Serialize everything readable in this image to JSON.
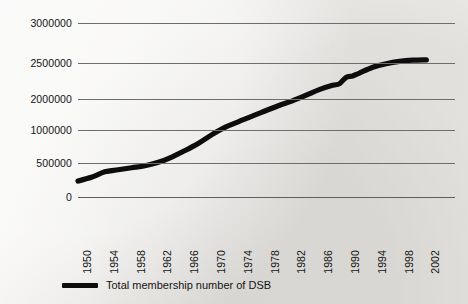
{
  "chart_data": {
    "type": "line",
    "title": "",
    "subtitle": "",
    "xlabel": "",
    "ylabel": "",
    "grid": true,
    "legend_position": "bottom-left",
    "x_tick_labels": [
      "1950",
      "1954",
      "1958",
      "1962",
      "1966",
      "1970",
      "1974",
      "1978",
      "1982",
      "1986",
      "1990",
      "1994",
      "1998",
      "2002"
    ],
    "y_tick_labels": [
      "3000000",
      "2500000",
      "2000000",
      "1000000",
      "500000",
      "0"
    ],
    "y_tick_values": [
      3000000,
      2500000,
      2000000,
      1000000,
      500000,
      0
    ],
    "y_axis_note": "Irregular tick spacing as printed: the 1500000 gridline is unlabelled and gaps between labelled ticks are not uniform.",
    "xlim": [
      1950,
      2002
    ],
    "ylim": [
      0,
      3000000
    ],
    "line_color": "#0d0d0d",
    "series": [
      {
        "name": "Total membership number of DSB",
        "x": [
          1950,
          1952,
          1954,
          1956,
          1958,
          1960,
          1962,
          1964,
          1966,
          1968,
          1970,
          1972,
          1974,
          1976,
          1978,
          1980,
          1982,
          1984,
          1986,
          1988,
          1989,
          1990,
          1991,
          1992,
          1994,
          1996,
          1998,
          2000,
          2002
        ],
        "values": [
          235000,
          290000,
          370000,
          400000,
          430000,
          460000,
          510000,
          590000,
          690000,
          800000,
          930000,
          1090000,
          1270000,
          1450000,
          1620000,
          1790000,
          1940000,
          2050000,
          2130000,
          2190000,
          2210000,
          2300000,
          2320000,
          2360000,
          2440000,
          2490000,
          2520000,
          2535000,
          2540000
        ]
      }
    ],
    "legend": [
      {
        "label": "Total membership number of DSB",
        "color": "#0d0d0d",
        "marker": "line"
      }
    ],
    "annotations": [
      {
        "text": "step increase around 1990",
        "x": 1990,
        "y": 2300000
      }
    ]
  },
  "legend": {
    "label": "Total membership number of DSB"
  },
  "axis_geometry": {
    "plot_left_px": 78,
    "plot_top_px": 18,
    "plot_width_px": 377,
    "plot_height_px": 184,
    "gridline_y_px": [
      5,
      45,
      81,
      112,
      145,
      179
    ],
    "x_first_tick_px": 0,
    "x_tick_step_px": 26.8
  }
}
